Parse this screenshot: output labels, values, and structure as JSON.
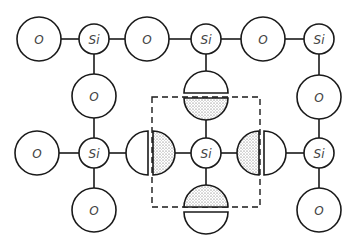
{
  "diagram": {
    "title": "",
    "labels": {
      "oxygen": "O",
      "silicon": "Si"
    },
    "colors": {
      "stroke": "#1a1a1a",
      "label": "#444444",
      "background": "#ffffff"
    },
    "atoms": [
      {
        "id": "o1",
        "type": "O",
        "x": 39,
        "y": 39
      },
      {
        "id": "si1",
        "type": "Si",
        "x": 94,
        "y": 39
      },
      {
        "id": "o2",
        "type": "O",
        "x": 147,
        "y": 39
      },
      {
        "id": "si2",
        "type": "Si",
        "x": 206,
        "y": 39
      },
      {
        "id": "o3",
        "type": "O",
        "x": 263,
        "y": 39
      },
      {
        "id": "si3",
        "type": "Si",
        "x": 319,
        "y": 39
      },
      {
        "id": "o4",
        "type": "O",
        "x": 94,
        "y": 96
      },
      {
        "id": "o5",
        "type": "O",
        "x": 319,
        "y": 97
      },
      {
        "id": "o6",
        "type": "O",
        "x": 37,
        "y": 153
      },
      {
        "id": "si4",
        "type": "Si",
        "x": 94,
        "y": 153
      },
      {
        "id": "si5",
        "type": "Si",
        "x": 206,
        "y": 153
      },
      {
        "id": "si6",
        "type": "Si",
        "x": 319,
        "y": 153
      },
      {
        "id": "o7",
        "type": "O",
        "x": 94,
        "y": 210
      },
      {
        "id": "o8",
        "type": "O",
        "x": 319,
        "y": 210
      }
    ],
    "shared_oxygens": [
      {
        "id": "so-top",
        "x": 206,
        "y": 96,
        "split": "horizontal",
        "shaded": "bottom"
      },
      {
        "id": "so-left",
        "x": 150,
        "y": 153,
        "split": "vertical",
        "shaded": "right"
      },
      {
        "id": "so-right",
        "x": 262,
        "y": 153,
        "split": "vertical",
        "shaded": "left"
      },
      {
        "id": "so-bottom",
        "x": 206,
        "y": 210,
        "split": "horizontal",
        "shaded": "top"
      }
    ],
    "unit_cell_box": {
      "x": 152,
      "y": 97,
      "width": 108,
      "height": 110,
      "style": "dashed"
    }
  }
}
